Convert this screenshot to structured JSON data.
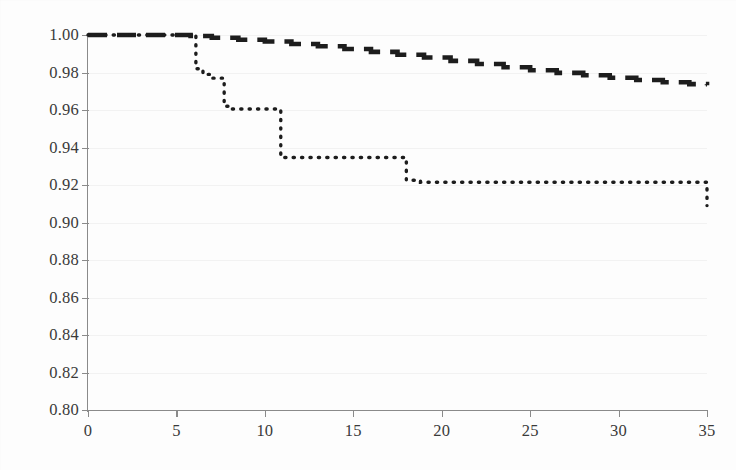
{
  "chart_data": {
    "type": "line",
    "title": "",
    "subtitle": "",
    "xlabel": "",
    "ylabel": "",
    "xlim": [
      0,
      35
    ],
    "ylim": [
      0.8,
      1.0
    ],
    "grid": true,
    "legend": "none",
    "y_ticks": [
      "1.00",
      "0.98",
      "0.96",
      "0.94",
      "0.92",
      "0.90",
      "0.88",
      "0.86",
      "0.84",
      "0.82",
      "0.80"
    ],
    "y_tick_values": [
      1.0,
      0.98,
      0.96,
      0.94,
      0.92,
      0.9,
      0.88,
      0.86,
      0.84,
      0.82,
      0.8
    ],
    "x_ticks": [
      "0",
      "5",
      "10",
      "15",
      "20",
      "25",
      "30",
      "35"
    ],
    "x_tick_values": [
      0,
      5,
      10,
      15,
      20,
      25,
      30,
      35
    ],
    "series": [
      {
        "name": "dashed-curve",
        "style": "dashed",
        "color": "#1d1d1d",
        "step": "post",
        "x": [
          0,
          5.0,
          5.8,
          7.0,
          8.5,
          10.0,
          11.5,
          13.0,
          14.5,
          16.0,
          17.5,
          19.0,
          20.5,
          22.0,
          23.5,
          25.0,
          26.5,
          28.0,
          29.5,
          31.0,
          32.5,
          34.0,
          35.0
        ],
        "y": [
          1.0,
          1.0,
          0.9995,
          0.9985,
          0.9975,
          0.9965,
          0.9952,
          0.994,
          0.9925,
          0.991,
          0.9895,
          0.988,
          0.9862,
          0.9845,
          0.9828,
          0.9812,
          0.9798,
          0.9785,
          0.9772,
          0.976,
          0.9748,
          0.9738,
          0.9732
        ]
      },
      {
        "name": "dotted-curve",
        "style": "dotted",
        "color": "#1d1d1d",
        "step": "post",
        "x": [
          0,
          5.7,
          6.1,
          6.5,
          6.9,
          7.7,
          8.0,
          10.9,
          17.5,
          18.0,
          18.8,
          35.0
        ],
        "y": [
          1.0,
          1.0,
          0.982,
          0.979,
          0.977,
          0.962,
          0.9605,
          0.9347,
          0.9347,
          0.9225,
          0.9215,
          0.909
        ]
      }
    ],
    "annotations": []
  }
}
